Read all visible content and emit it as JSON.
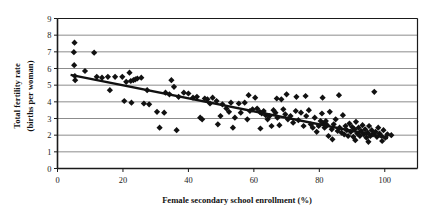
{
  "chart_data": {
    "type": "scatter",
    "title": "",
    "xlabel": "Female secondary school enrollment (%)",
    "ylabel": "Total fertility rate (births per woman)",
    "ylabel_line1": "Total fertility rate",
    "ylabel_line2": "(births per woman)",
    "xlim": [
      0,
      110
    ],
    "ylim": [
      0,
      9
    ],
    "xticks": [
      0,
      20,
      40,
      60,
      80,
      100
    ],
    "xtick_labels": [
      "0",
      "20",
      "40",
      "60",
      "80",
      "100"
    ],
    "yticks": [
      0,
      1,
      2,
      3,
      4,
      5,
      6,
      7,
      8,
      9
    ],
    "ytick_labels": [
      "0",
      "1",
      "2",
      "3",
      "4",
      "5",
      "6",
      "7",
      "8",
      "9"
    ],
    "grid": "horizontal",
    "grid_color": "#8c8c8c",
    "frame_color": "#1a1a1a",
    "marker": "diamond",
    "marker_color": "#111111",
    "marker_size": 3.1,
    "trendline": {
      "label": "linear fit",
      "color": "#111111",
      "width": 2.3,
      "x_start": 4,
      "y_start": 5.62,
      "x_end": 101,
      "y_end": 1.83
    },
    "series": [
      {
        "name": "Countries",
        "points": [
          [
            5.2,
            7.55
          ],
          [
            5.0,
            6.98
          ],
          [
            5.1,
            6.2
          ],
          [
            5.3,
            5.55
          ],
          [
            5.4,
            5.3
          ],
          [
            8.4,
            5.85
          ],
          [
            11.2,
            6.95
          ],
          [
            12.0,
            5.5
          ],
          [
            13.6,
            5.45
          ],
          [
            15.4,
            5.5
          ],
          [
            16.0,
            4.7
          ],
          [
            17.6,
            5.5
          ],
          [
            19.8,
            5.5
          ],
          [
            20.4,
            4.05
          ],
          [
            21.0,
            5.2
          ],
          [
            22.0,
            5.75
          ],
          [
            22.4,
            5.25
          ],
          [
            23.2,
            5.3
          ],
          [
            23.8,
            5.35
          ],
          [
            24.4,
            5.4
          ],
          [
            25.6,
            5.45
          ],
          [
            22.6,
            3.95
          ],
          [
            26.4,
            3.9
          ],
          [
            27.4,
            4.7
          ],
          [
            28.0,
            3.85
          ],
          [
            30.4,
            3.4
          ],
          [
            31.2,
            2.45
          ],
          [
            32.6,
            3.35
          ],
          [
            33.0,
            4.55
          ],
          [
            34.2,
            4.45
          ],
          [
            34.8,
            5.3
          ],
          [
            35.6,
            4.9
          ],
          [
            36.4,
            2.3
          ],
          [
            37.0,
            4.3
          ],
          [
            38.6,
            4.55
          ],
          [
            40.0,
            4.5
          ],
          [
            41.4,
            4.25
          ],
          [
            42.6,
            4.3
          ],
          [
            43.6,
            3.05
          ],
          [
            44.2,
            2.95
          ],
          [
            45.0,
            4.2
          ],
          [
            45.8,
            4.15
          ],
          [
            46.6,
            3.9
          ],
          [
            47.4,
            4.25
          ],
          [
            48.6,
            4.05
          ],
          [
            49.8,
            3.15
          ],
          [
            50.4,
            3.85
          ],
          [
            51.6,
            3.6
          ],
          [
            52.4,
            3.4
          ],
          [
            53.0,
            3.95
          ],
          [
            54.2,
            3.05
          ],
          [
            55.4,
            3.9
          ],
          [
            56.0,
            3.35
          ],
          [
            57.2,
            3.95
          ],
          [
            58.0,
            2.95
          ],
          [
            58.8,
            3.45
          ],
          [
            59.6,
            3.55
          ],
          [
            60.4,
            4.25
          ],
          [
            61.0,
            3.6
          ],
          [
            61.8,
            3.4
          ],
          [
            62.4,
            3.3
          ],
          [
            63.0,
            3.45
          ],
          [
            63.6,
            3.2
          ],
          [
            64.2,
            2.95
          ],
          [
            64.8,
            3.15
          ],
          [
            65.4,
            2.55
          ],
          [
            66.0,
            3.5
          ],
          [
            66.6,
            3.35
          ],
          [
            67.2,
            3.05
          ],
          [
            67.8,
            2.6
          ],
          [
            68.4,
            4.15
          ],
          [
            69.0,
            3.55
          ],
          [
            69.6,
            3.25
          ],
          [
            70.4,
            2.95
          ],
          [
            71.2,
            3.15
          ],
          [
            72.0,
            2.75
          ],
          [
            72.8,
            3.45
          ],
          [
            73.6,
            2.9
          ],
          [
            74.4,
            3.35
          ],
          [
            75.2,
            2.55
          ],
          [
            76.0,
            3.15
          ],
          [
            76.8,
            3.5
          ],
          [
            77.4,
            2.65
          ],
          [
            78.0,
            2.45
          ],
          [
            78.6,
            3.05
          ],
          [
            79.2,
            2.2
          ],
          [
            79.8,
            2.55
          ],
          [
            80.4,
            2.85
          ],
          [
            80.8,
            3.3
          ],
          [
            81.2,
            2.7
          ],
          [
            81.6,
            2.45
          ],
          [
            82.0,
            2.85
          ],
          [
            82.4,
            2.6
          ],
          [
            82.8,
            1.95
          ],
          [
            83.2,
            3.4
          ],
          [
            83.8,
            2.35
          ],
          [
            84.4,
            2.65
          ],
          [
            85.0,
            2.95
          ],
          [
            85.6,
            2.25
          ],
          [
            86.2,
            2.45
          ],
          [
            86.8,
            2.15
          ],
          [
            87.2,
            3.2
          ],
          [
            87.6,
            2.05
          ],
          [
            88.0,
            2.55
          ],
          [
            88.4,
            2.3
          ],
          [
            88.8,
            1.95
          ],
          [
            89.2,
            2.7
          ],
          [
            89.6,
            2.2
          ],
          [
            90.0,
            2.5
          ],
          [
            90.4,
            1.9
          ],
          [
            90.8,
            2.35
          ],
          [
            91.2,
            2.8
          ],
          [
            91.6,
            2.1
          ],
          [
            92.0,
            2.45
          ],
          [
            92.4,
            1.95
          ],
          [
            92.8,
            2.25
          ],
          [
            93.2,
            2.6
          ],
          [
            93.6,
            2.05
          ],
          [
            94.0,
            2.35
          ],
          [
            94.4,
            1.85
          ],
          [
            94.8,
            2.15
          ],
          [
            95.2,
            2.55
          ],
          [
            95.6,
            1.95
          ],
          [
            96.0,
            2.3
          ],
          [
            96.4,
            2.05
          ],
          [
            96.8,
            4.6
          ],
          [
            97.2,
            2.2
          ],
          [
            97.6,
            1.9
          ],
          [
            98.0,
            2.45
          ],
          [
            98.4,
            2.1
          ],
          [
            99.0,
            1.95
          ],
          [
            99.6,
            2.3
          ],
          [
            100.2,
            1.85
          ],
          [
            100.8,
            2.05
          ],
          [
            86.0,
            4.4
          ],
          [
            75.8,
            4.35
          ],
          [
            70.0,
            4.45
          ],
          [
            58.4,
            4.4
          ],
          [
            49.0,
            2.65
          ],
          [
            53.6,
            2.45
          ],
          [
            62.0,
            2.4
          ],
          [
            67.0,
            4.2
          ],
          [
            73.0,
            4.3
          ],
          [
            81.0,
            4.25
          ],
          [
            84.0,
            1.75
          ],
          [
            91.0,
            1.7
          ],
          [
            95.0,
            1.6
          ],
          [
            99.2,
            1.65
          ],
          [
            102.0,
            2.0
          ]
        ]
      }
    ]
  }
}
